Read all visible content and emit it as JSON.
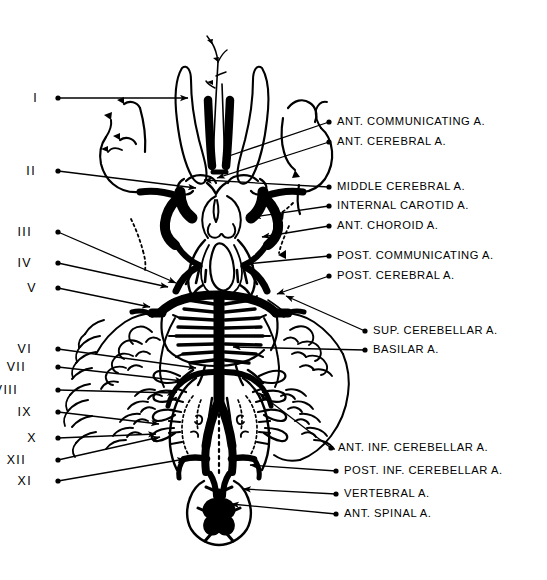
{
  "figure": {
    "ink_color": "#000000",
    "background_color": "#ffffff",
    "width": 547,
    "height": 580
  },
  "cranial_nerve_labels": [
    {
      "id": "cn-1",
      "text": "I",
      "x": 38,
      "y": 98,
      "dot_x": 58,
      "dot_y": 98,
      "tip_x": 188,
      "tip_y": 98
    },
    {
      "id": "cn-2",
      "text": "II",
      "x": 36,
      "y": 171,
      "dot_x": 58,
      "dot_y": 171,
      "tip_x": 196,
      "tip_y": 188
    },
    {
      "id": "cn-3",
      "text": "III",
      "x": 32,
      "y": 232,
      "dot_x": 58,
      "dot_y": 232,
      "tip_x": 176,
      "tip_y": 283
    },
    {
      "id": "cn-4",
      "text": "IV",
      "x": 32,
      "y": 263,
      "dot_x": 58,
      "dot_y": 263,
      "tip_x": 168,
      "tip_y": 287
    },
    {
      "id": "cn-5",
      "text": "V",
      "x": 37,
      "y": 288,
      "dot_x": 58,
      "dot_y": 288,
      "tip_x": 150,
      "tip_y": 307
    },
    {
      "id": "cn-6",
      "text": "VI",
      "x": 32,
      "y": 349,
      "dot_x": 58,
      "dot_y": 349,
      "tip_x": 196,
      "tip_y": 368
    },
    {
      "id": "cn-7",
      "text": "VII",
      "x": 26,
      "y": 367,
      "dot_x": 58,
      "dot_y": 367,
      "tip_x": 183,
      "tip_y": 381
    },
    {
      "id": "cn-8",
      "text": "VIII",
      "x": 18,
      "y": 390,
      "dot_x": 58,
      "dot_y": 390,
      "tip_x": 175,
      "tip_y": 393
    },
    {
      "id": "cn-9",
      "text": "IX",
      "x": 32,
      "y": 412,
      "dot_x": 58,
      "dot_y": 412,
      "tip_x": 159,
      "tip_y": 424
    },
    {
      "id": "cn-10",
      "text": "X",
      "x": 37,
      "y": 438,
      "dot_x": 58,
      "dot_y": 438,
      "tip_x": 156,
      "tip_y": 434
    },
    {
      "id": "cn-12",
      "text": "XII",
      "x": 26,
      "y": 460,
      "dot_x": 58,
      "dot_y": 460,
      "tip_x": 160,
      "tip_y": 437
    },
    {
      "id": "cn-11",
      "text": "XI",
      "x": 32,
      "y": 481,
      "dot_x": 58,
      "dot_y": 481,
      "tip_x": 185,
      "tip_y": 459
    }
  ],
  "artery_labels": [
    {
      "id": "ant-communicating",
      "text": "ANT.  COMMUNICATING A.",
      "x": 337,
      "y": 122,
      "dot_x": 329,
      "dot_y": 122,
      "tip_x": 223,
      "tip_y": 158
    },
    {
      "id": "ant-cerebral",
      "text": "ANT. CEREBRAL A.",
      "x": 337,
      "y": 142,
      "dot_x": 329,
      "dot_y": 142,
      "tip_x": 217,
      "tip_y": 178
    },
    {
      "id": "middle-cerebral",
      "text": "MIDDLE  CEREBRAL A.",
      "x": 337,
      "y": 187,
      "dot_x": 329,
      "dot_y": 187,
      "tip_x": 204,
      "tip_y": 180
    },
    {
      "id": "internal-carotid",
      "text": "INTERNAL  CAROTID A.",
      "x": 337,
      "y": 206,
      "dot_x": 329,
      "dot_y": 206,
      "tip_x": 253,
      "tip_y": 217
    },
    {
      "id": "ant-choroid",
      "text": "ANT. CHOROID A.",
      "x": 337,
      "y": 226,
      "dot_x": 329,
      "dot_y": 226,
      "tip_x": 262,
      "tip_y": 237
    },
    {
      "id": "post-communicating",
      "text": "POST. COMMUNICATING A.",
      "x": 337,
      "y": 256,
      "dot_x": 329,
      "dot_y": 256,
      "tip_x": 246,
      "tip_y": 264
    },
    {
      "id": "post-cerebral",
      "text": "POST. CEREBRAL A.",
      "x": 337,
      "y": 276,
      "dot_x": 329,
      "dot_y": 276,
      "tip_x": 277,
      "tip_y": 294
    },
    {
      "id": "sup-cerebellar",
      "text": "SUP.  CEREBELLAR A.",
      "x": 373,
      "y": 331,
      "dot_x": 365,
      "dot_y": 331,
      "tip_x": 286,
      "tip_y": 296
    },
    {
      "id": "basilar",
      "text": "BASILAR  A.",
      "x": 373,
      "y": 350,
      "dot_x": 365,
      "dot_y": 350,
      "tip_x": 233,
      "tip_y": 347
    },
    {
      "id": "ant-inf-cerebellar",
      "text": "ANT. INF. CEREBELLAR  A.",
      "x": 338,
      "y": 448,
      "dot_x": 331,
      "dot_y": 448,
      "tip_x": 259,
      "tip_y": 393
    },
    {
      "id": "post-inf-cerebellar",
      "text": "POST. INF. CEREBELLAR A.",
      "x": 344,
      "y": 471,
      "dot_x": 336,
      "dot_y": 471,
      "tip_x": 250,
      "tip_y": 465
    },
    {
      "id": "vertebral",
      "text": "VERTEBRAL  A.",
      "x": 344,
      "y": 494,
      "dot_x": 336,
      "dot_y": 494,
      "tip_x": 243,
      "tip_y": 489
    },
    {
      "id": "ant-spinal",
      "text": "ANT. SPINAL A.",
      "x": 344,
      "y": 514,
      "dot_x": 336,
      "dot_y": 514,
      "tip_x": 231,
      "tip_y": 504
    }
  ]
}
